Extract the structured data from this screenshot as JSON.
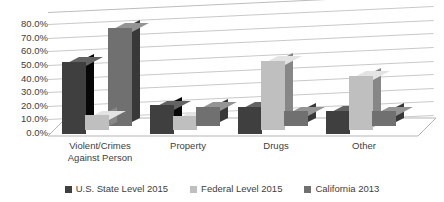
{
  "chart_data": {
    "type": "bar",
    "title": "",
    "subtitle": "",
    "xlabel": "",
    "ylabel": "",
    "categories": [
      "Violent/Crimes\nAgainst Person",
      "Property",
      "Drugs",
      "Other"
    ],
    "series": [
      {
        "name": "U.S. State Level 2015",
        "color": "#3f3f3f",
        "values": [
          53.0,
          21.0,
          20.0,
          17.0
        ]
      },
      {
        "name": "Federal Level 2015",
        "color": "#bfbfbf",
        "values": [
          11.0,
          10.0,
          51.0,
          40.0
        ]
      },
      {
        "name": "California 2013",
        "color": "#707070",
        "values": [
          72.0,
          14.0,
          11.0,
          11.0
        ]
      }
    ],
    "ylim": [
      0,
      80
    ],
    "ytick_values": [
      0,
      10,
      20,
      30,
      40,
      50,
      60,
      70,
      80
    ],
    "ytick_labels": [
      "0.0%",
      "10.0%",
      "20.0%",
      "30.0%",
      "40.0%",
      "50.0%",
      "60.0%",
      "70.0%",
      "80.0%"
    ],
    "grid": true,
    "grid_color": "#c9c9c9",
    "legend_position": "bottom",
    "three_d": true,
    "background": "#ffffff"
  },
  "legend": {
    "items": [
      {
        "label": "U.S. State Level 2015",
        "color": "#3f3f3f"
      },
      {
        "label": "Federal Level 2015",
        "color": "#bfbfbf"
      },
      {
        "label": "California 2013",
        "color": "#707070"
      }
    ]
  }
}
